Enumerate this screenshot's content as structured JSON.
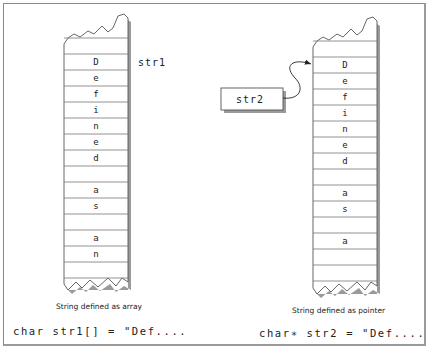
{
  "left": {
    "label": "str1",
    "cells": [
      "",
      "D",
      "e",
      "f",
      "i",
      "n",
      "e",
      "d",
      "",
      "a",
      "s",
      "",
      "a",
      "n",
      ""
    ],
    "caption": "String defined as array",
    "code": "char str1[] = \"Def...."
  },
  "right": {
    "pointer_label": "str2",
    "cells": [
      "",
      "D",
      "e",
      "f",
      "i",
      "n",
      "e",
      "d",
      "",
      "a",
      "s",
      "",
      "a",
      "",
      ""
    ],
    "caption": "String defined as pointer",
    "code": "char∗ str2 = \"Def...."
  },
  "colors": {
    "line": "#555555",
    "shadow": "#9a9a9a",
    "text": "#222222"
  }
}
